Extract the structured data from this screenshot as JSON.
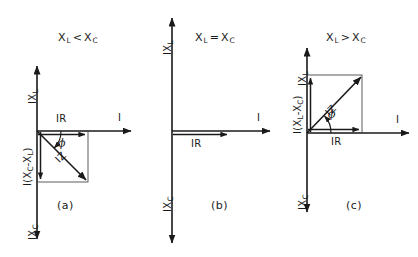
{
  "figure": {
    "panels": [
      {
        "id": "a",
        "caption": "(a)",
        "relation": {
          "left": "X",
          "left_sub": "L",
          "operator": "<",
          "right": "X",
          "right_sub": "C"
        },
        "axes": {
          "up_label": "IX",
          "up_sub": "L",
          "down_label": "IX",
          "down_sub": "C",
          "right_label": "I"
        },
        "resistive_label": "IR",
        "reactive_label": "I(X",
        "reactive_sub1": "C",
        "reactive_mid": "-X",
        "reactive_sub2": "L",
        "reactive_end": ")",
        "impedance_label": "IZ",
        "angle_label": "ϕ",
        "phasor_direction": "down-right",
        "angle_degrees": -45
      },
      {
        "id": "b",
        "caption": "(b)",
        "relation": {
          "left": "X",
          "left_sub": "L",
          "operator": "=",
          "right": "X",
          "right_sub": "C"
        },
        "axes": {
          "up_label": "IX",
          "up_sub": "L",
          "down_label": "IX",
          "down_sub": "C",
          "right_label": "I"
        },
        "resistive_label": "IR",
        "reactive_label": null,
        "impedance_label": null,
        "angle_label": null,
        "phasor_direction": "right",
        "angle_degrees": 0
      },
      {
        "id": "c",
        "caption": "(c)",
        "relation": {
          "left": "X",
          "left_sub": "L",
          "operator": ">",
          "right": "X",
          "right_sub": "C"
        },
        "axes": {
          "up_label": "IX",
          "up_sub": "L",
          "down_label": "IX",
          "down_sub": "C",
          "right_label": "I"
        },
        "resistive_label": "IR",
        "reactive_label": "I(X",
        "reactive_sub1": "L",
        "reactive_mid": "-X",
        "reactive_sub2": "C",
        "reactive_end": ")",
        "impedance_label": "IZ",
        "angle_label": "ϕ",
        "phasor_direction": "up-right",
        "angle_degrees": 45
      }
    ],
    "colors": {
      "stroke": "#1a1a1a",
      "thin_stroke": "#333333",
      "background": "#ffffff"
    }
  }
}
